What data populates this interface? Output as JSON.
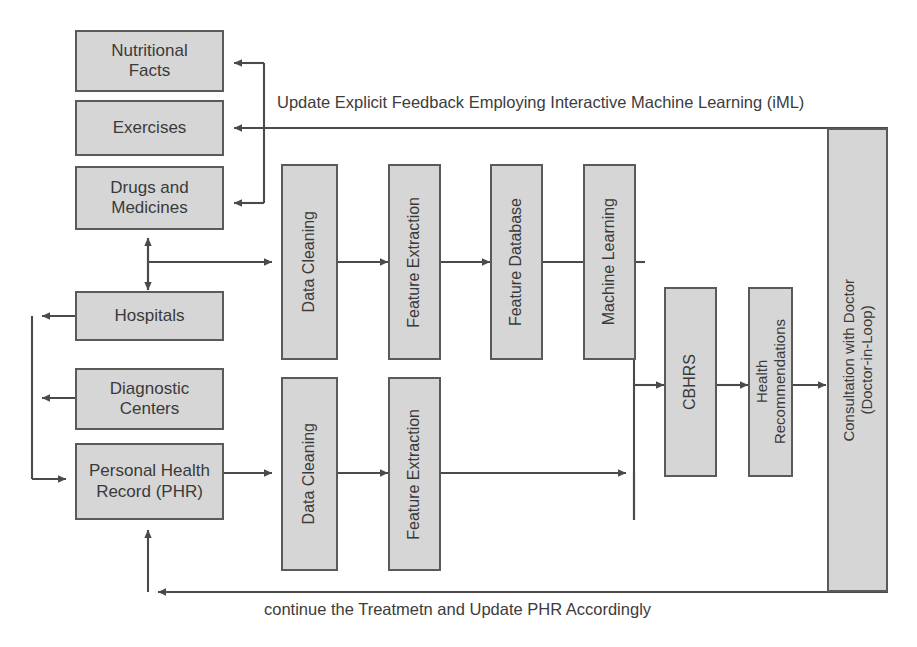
{
  "diagram": {
    "colors": {
      "node_fill": "#d6d6d6",
      "node_border": "#5a5a5a",
      "wire": "#4a4a4a",
      "text": "#3a3a3a",
      "background": "#ffffff"
    },
    "nodes": {
      "nutritional_facts": {
        "label": "Nutritional\nFacts",
        "orientation": "horizontal"
      },
      "exercises": {
        "label": "Exercises",
        "orientation": "horizontal"
      },
      "drugs_and_medicines": {
        "label": "Drugs and\nMedicines",
        "orientation": "horizontal"
      },
      "hospitals": {
        "label": "Hospitals",
        "orientation": "horizontal"
      },
      "diagnostic_centers": {
        "label": "Diagnostic\nCenters",
        "orientation": "horizontal"
      },
      "personal_health_record": {
        "label": "Personal Health\nRecord (PHR)",
        "orientation": "horizontal"
      },
      "data_cleaning_top": {
        "label": "Data Cleaning",
        "orientation": "vertical"
      },
      "feature_extraction_top": {
        "label": "Feature Extraction",
        "orientation": "vertical"
      },
      "feature_database": {
        "label": "Feature Database",
        "orientation": "vertical"
      },
      "machine_learning": {
        "label": "Machine Learning",
        "orientation": "vertical"
      },
      "data_cleaning_bottom": {
        "label": "Data Cleaning",
        "orientation": "vertical"
      },
      "feature_extraction_bottom": {
        "label": "Feature Extraction",
        "orientation": "vertical"
      },
      "cbhrs": {
        "label": "CBHRS",
        "orientation": "vertical"
      },
      "health_recommendations": {
        "label": "Health\nRecommendations",
        "orientation": "vertical"
      },
      "consultation_with_doctor": {
        "label": "Consultation with Doctor\n(Doctor-in-Loop)",
        "orientation": "vertical"
      }
    },
    "edge_labels": {
      "feedback_top": "Update Explicit Feedback Employing Interactive Machine Learning (iML)",
      "feedback_bottom": "continue the Treatmetn and Update PHR Accordingly"
    }
  }
}
